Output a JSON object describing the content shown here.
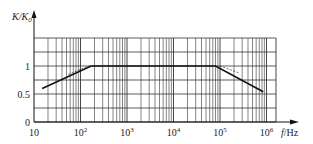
{
  "chart_data": {
    "type": "line",
    "title": "",
    "xlabel": "f/Hz",
    "ylabel": "K/K0",
    "xscale": "log",
    "xlim": [
      10,
      1600000
    ],
    "ylim": [
      0,
      1.5
    ],
    "grid": true,
    "legend": null,
    "x_ticks": [
      {
        "value": 10,
        "label": "10"
      },
      {
        "value": 100,
        "label": "10",
        "sup": "2"
      },
      {
        "value": 1000,
        "label": "10",
        "sup": "3"
      },
      {
        "value": 10000,
        "label": "10",
        "sup": "4"
      },
      {
        "value": 100000,
        "label": "10",
        "sup": "5"
      },
      {
        "value": 1000000,
        "label": "10",
        "sup": "6"
      }
    ],
    "y_ticks": [
      {
        "value": 0,
        "label": "0"
      },
      {
        "value": 0.5,
        "label": "0.5"
      },
      {
        "value": 1,
        "label": "1"
      }
    ],
    "y_gridlines": [
      0,
      0.25,
      0.5,
      0.75,
      1.0,
      1.25,
      1.5
    ],
    "series": [
      {
        "name": "K/K0 frequency response",
        "style": "solid",
        "x": [
          15,
          170,
          80000,
          850000
        ],
        "y": [
          0.6,
          1.0,
          1.0,
          0.54
        ]
      },
      {
        "name": "asymptote-low",
        "style": "dashed-thin",
        "x": [
          55,
          150
        ],
        "y": [
          0.85,
          1.0
        ]
      },
      {
        "name": "asymptote-high",
        "style": "dashed-thin",
        "x": [
          100000,
          250000
        ],
        "y": [
          1.0,
          0.88
        ]
      }
    ]
  },
  "axes": {
    "y_label_main": "K/K",
    "y_label_sub": "0",
    "x_label_f": "f",
    "x_label_unit": "/Hz"
  }
}
